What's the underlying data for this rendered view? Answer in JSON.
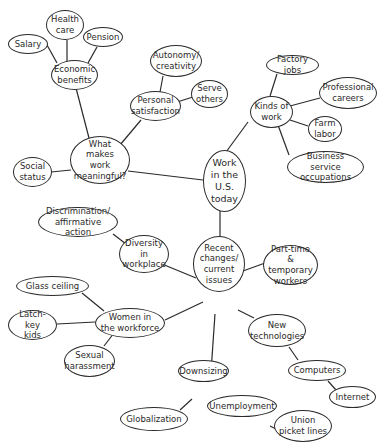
{
  "nodes": {
    "center": "Work\nin the\nU.S.\ntoday",
    "meaningful": "What makes\nwork\nmeaningful?",
    "economic": "Economic\nbenefits",
    "salary": "Salary",
    "health": "Health\ncare",
    "pension": "Pension",
    "personal": "Personal\nsatisfaction",
    "autonomy": "Autonomy/\ncreativity",
    "serve": "Serve\nothers",
    "social": "Social\nstatus",
    "kinds": "Kinds of\nwork",
    "factory": "Factory jobs",
    "professional": "Professional\ncareers",
    "farm": "Farm\nlabor",
    "business": "Business service\noccupations",
    "recent": "Recent\nchanges/\ncurrent\nissues",
    "parttime": "Part-time &\ntemporary\nworkers",
    "diversity": "Diversity\nin\nworkplace",
    "discrimination": "Discrimination/\naffirmative action",
    "women": "Women in\nthe workforce",
    "glass": "Glass ceiling",
    "latchkey": "Latch-key\nkids",
    "harassment": "Sexual\nharassment",
    "newtech": "New\ntechnologies",
    "computers": "Computers",
    "internet": "Internet",
    "downsizing": "Downsizing",
    "globalization": "Globalization",
    "unemployment": "Unemployment",
    "union": "Union\npicket lines"
  }
}
